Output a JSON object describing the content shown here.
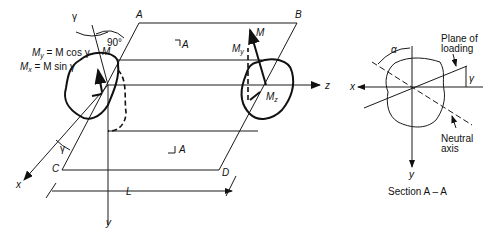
{
  "figure": {
    "main": {
      "corners": {
        "A": "A",
        "B": "B",
        "C": "C",
        "D": "D"
      },
      "axes": {
        "x": "x",
        "y": "y",
        "z": "z"
      },
      "length_label": "L",
      "section_marker": "A",
      "section_marker_bottom": "A",
      "angle_gamma": "γ",
      "angle_gamma_bottom": "γ",
      "right_angle": "90°",
      "moment": "M",
      "moment_right": "M",
      "eq_my_lhs": "M",
      "eq_my_sub": "y",
      "eq_my_rhs": " = M cos γ",
      "eq_mx_lhs": "M",
      "eq_mx_sub": "x",
      "eq_mx_rhs": " = M sin γ",
      "my_right": "M",
      "my_right_sub": "y",
      "mz_right": "M",
      "mz_right_sub": "z"
    },
    "section": {
      "title": "Section A – A",
      "axis_x": "x",
      "axis_y": "y",
      "alpha": "α",
      "gamma": "γ",
      "plane_label_1": "Plane of",
      "plane_label_2": "loading",
      "neutral_label_1": "Neutral",
      "neutral_label_2": "axis"
    }
  }
}
